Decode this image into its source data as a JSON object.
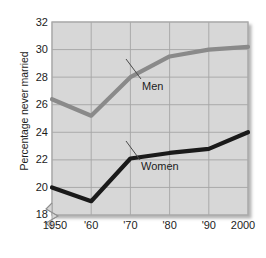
{
  "chart_data": {
    "type": "line",
    "title": "",
    "xlabel": "",
    "ylabel": "Percentage never married",
    "x": [
      1950,
      1960,
      1970,
      1980,
      1990,
      2000
    ],
    "xtick_labels": [
      "1950",
      "'60",
      "'70",
      "'80",
      "'90",
      "2000"
    ],
    "ytick_labels": [
      "18",
      "20",
      "22",
      "24",
      "26",
      "28",
      "30",
      "32"
    ],
    "yticks": [
      18,
      20,
      22,
      24,
      26,
      28,
      30,
      32
    ],
    "ylim": [
      18,
      32
    ],
    "xlim": [
      1950,
      2000
    ],
    "y_axis_break": true,
    "grid": true,
    "legend_position": "inline-annotation",
    "series": [
      {
        "name": "Men",
        "color": "#8a8a8a",
        "values": [
          26.4,
          25.2,
          28.0,
          29.5,
          30.0,
          30.2
        ]
      },
      {
        "name": "Women",
        "color": "#1a1a1a",
        "values": [
          20.0,
          19.0,
          22.1,
          22.5,
          22.8,
          24.0
        ]
      }
    ],
    "annotations": [
      {
        "text": "Men",
        "series": "Men"
      },
      {
        "text": "Women",
        "series": "Women"
      }
    ],
    "plot_background": "#d7d7d7",
    "grid_color": "#a8a8a8"
  },
  "axis": {
    "y_title": "Percentage never married"
  }
}
